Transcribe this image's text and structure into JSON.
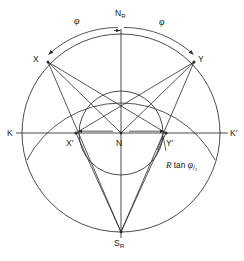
{
  "figure": {
    "type": "geometric-diagram",
    "background_color": "#ffffff",
    "stroke_color": "#2b2b2b",
    "label_color": "#1a1a1a",
    "center": {
      "name": "N",
      "x": 121,
      "y": 133
    },
    "labels": {
      "north_pole": "N",
      "north_pole_sub": "R",
      "south_pole": "S",
      "south_pole_sub": "R",
      "left_axis": "K",
      "right_axis": "K",
      "right_axis_prime": "′",
      "upper_left_point": "X",
      "upper_right_point": "Y",
      "lower_left_point": "X",
      "lower_left_prime": "′",
      "lower_right_point": "Y",
      "lower_right_prime": "′",
      "center_point": "N",
      "angle_left": "φ",
      "angle_right": "φ"
    },
    "annotation": {
      "radius_symbol": "R",
      "function_text": " tan ",
      "angle_symbol": "φ",
      "fraction_text": "/₂"
    },
    "geometry": {
      "outer_circle_radius": 99,
      "arc_circle_radius": 106,
      "inner_circle_radius": 42,
      "points": {
        "N_R": {
          "x": 121,
          "y": 34
        },
        "S_R": {
          "x": 121,
          "y": 232
        },
        "K": {
          "x": 22,
          "y": 133
        },
        "K_prime": {
          "x": 220,
          "y": 133
        },
        "X": {
          "x": 48,
          "y": 62
        },
        "Y": {
          "x": 194,
          "y": 62
        },
        "X_prime": {
          "x": 76,
          "y": 133
        },
        "Y_prime": {
          "x": 166,
          "y": 133
        }
      }
    }
  }
}
